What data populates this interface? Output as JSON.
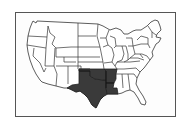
{
  "map": {
    "title": "",
    "region": "Contiguous United States",
    "highlighted_states": [
      "Texas",
      "Oklahoma",
      "Arkansas",
      "Louisiana"
    ],
    "colors": {
      "highlight": "#3a3a3a",
      "base": "#ffffff",
      "border": "#333333",
      "frame": "#555555"
    }
  }
}
